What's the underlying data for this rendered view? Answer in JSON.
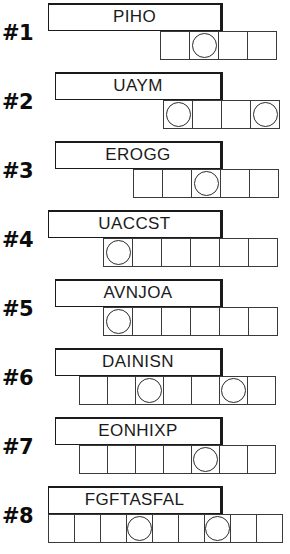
{
  "page": {
    "ink_color": "#1a1a1a",
    "paper_color": "#ffffff",
    "grid_line_color": "#3a3a3a"
  },
  "puzzles": [
    {
      "label": "#1",
      "scrambled_word": "PIHO",
      "letter_count": 4,
      "word_box": {
        "left": 48,
        "width": 175
      },
      "grid": {
        "left": 160,
        "cell_width": 30,
        "cells": 4
      },
      "circled_cells": [
        2
      ]
    },
    {
      "label": "#2",
      "scrambled_word": "UAYM",
      "letter_count": 4,
      "word_box": {
        "left": 55,
        "width": 168
      },
      "grid": {
        "left": 163,
        "cell_width": 30,
        "cells": 4
      },
      "circled_cells": [
        1,
        4
      ]
    },
    {
      "label": "#3",
      "scrambled_word": "EROGG",
      "letter_count": 5,
      "word_box": {
        "left": 55,
        "width": 168
      },
      "grid": {
        "left": 133,
        "cell_width": 30,
        "cells": 5
      },
      "circled_cells": [
        3
      ]
    },
    {
      "label": "#4",
      "scrambled_word": "UACCST",
      "letter_count": 6,
      "word_box": {
        "left": 48,
        "width": 175
      },
      "grid": {
        "left": 103,
        "cell_width": 30,
        "cells": 6
      },
      "circled_cells": [
        1
      ]
    },
    {
      "label": "#5",
      "scrambled_word": "AVNJOA",
      "letter_count": 6,
      "word_box": {
        "left": 55,
        "width": 168
      },
      "grid": {
        "left": 103,
        "cell_width": 30,
        "cells": 6
      },
      "circled_cells": [
        1
      ]
    },
    {
      "label": "#6",
      "scrambled_word": "DAINISN",
      "letter_count": 7,
      "word_box": {
        "left": 55,
        "width": 168
      },
      "grid": {
        "left": 79,
        "cell_width": 29,
        "cells": 7
      },
      "circled_cells": [
        3,
        6
      ]
    },
    {
      "label": "#7",
      "scrambled_word": "EONHIXP",
      "letter_count": 7,
      "word_box": {
        "left": 55,
        "width": 168
      },
      "grid": {
        "left": 79,
        "cell_width": 29,
        "cells": 7
      },
      "circled_cells": [
        5
      ]
    },
    {
      "label": "#8",
      "scrambled_word": "FGFTASFAL",
      "letter_count": 9,
      "word_box": {
        "left": 48,
        "width": 175
      },
      "grid": {
        "left": 48,
        "cell_width": 27,
        "cells": 9
      },
      "circled_cells": [
        4,
        7
      ]
    }
  ]
}
